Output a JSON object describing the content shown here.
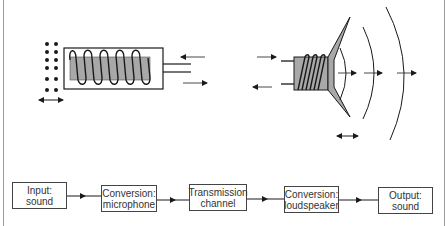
{
  "figure": {
    "top_illustrations": {
      "microphone": {
        "label": "microphone-illustration"
      },
      "loudspeaker": {
        "label": "loudspeaker-illustration"
      }
    },
    "flow": {
      "steps": [
        {
          "line1": "Input:",
          "line2": "sound"
        },
        {
          "line1": "Conversion:",
          "line2": "microphone"
        },
        {
          "line1": "Transmission",
          "line2": "channel"
        },
        {
          "line1": "Conversion:",
          "line2": "loudspeaker"
        },
        {
          "line1": "Output:",
          "line2": "sound"
        }
      ]
    },
    "colors": {
      "line": "#1a1a1a",
      "core_fill": "#a8a8a8",
      "frame": "#9a9a9a"
    }
  }
}
